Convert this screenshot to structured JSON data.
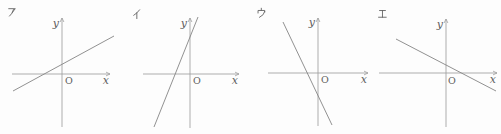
{
  "figure": {
    "width": 501,
    "height": 134,
    "background": "#fdfdfd",
    "axis_color": "#9e9e9e",
    "line_color": "#858585",
    "label_color": "#606060"
  },
  "chart_data": [
    {
      "type": "line",
      "panel_label": "ア",
      "x_axis_label": "x",
      "y_axis_label": "y",
      "origin_label": "O",
      "slope_sign": "positive",
      "slope_steepness": "gentle",
      "approx_slope": 0.55,
      "y_intercept_sign": "positive",
      "x_intercept_sign": "negative",
      "axis_ticks": "none",
      "legend": "none"
    },
    {
      "type": "line",
      "panel_label": "イ",
      "x_axis_label": "x",
      "y_axis_label": "y",
      "origin_label": "O",
      "slope_sign": "positive",
      "slope_steepness": "steep",
      "approx_slope": 2.5,
      "y_intercept_sign": "positive",
      "x_intercept_sign": "negative",
      "axis_ticks": "none",
      "legend": "none"
    },
    {
      "type": "line",
      "panel_label": "ウ",
      "x_axis_label": "x",
      "y_axis_label": "y",
      "origin_label": "O",
      "slope_sign": "negative",
      "slope_steepness": "steep",
      "approx_slope": -2.1,
      "y_intercept_sign": "negative",
      "x_intercept_sign": "negative",
      "axis_ticks": "none",
      "legend": "none"
    },
    {
      "type": "line",
      "panel_label": "エ",
      "x_axis_label": "x",
      "y_axis_label": "y",
      "origin_label": "O",
      "slope_sign": "negative",
      "slope_steepness": "gentle",
      "approx_slope": -0.52,
      "y_intercept_sign": "positive",
      "x_intercept_sign": "positive",
      "axis_ticks": "none",
      "legend": "none"
    }
  ],
  "panels": [
    {
      "label": "ア",
      "glyph": "katakana-a",
      "label_pos": [
        8,
        7
      ],
      "x_axis": [
        12,
        74,
        110,
        74
      ],
      "y_axis": [
        62,
        127,
        62,
        18
      ],
      "line": [
        13,
        91,
        114,
        36
      ],
      "x_label": "x",
      "x_label_pos": [
        109,
        84
      ],
      "y_label": "y",
      "y_label_pos": [
        59,
        27
      ],
      "origin_label": "O",
      "origin_pos": [
        65,
        84
      ]
    },
    {
      "label": "イ",
      "glyph": "katakana-i",
      "label_pos": [
        133,
        9
      ],
      "x_axis": [
        143,
        74,
        239,
        74
      ],
      "y_axis": [
        190,
        128,
        190,
        18
      ],
      "line": [
        154,
        127,
        198,
        17
      ],
      "x_label": "x",
      "x_label_pos": [
        238,
        84
      ],
      "y_label": "y",
      "y_label_pos": [
        187,
        27
      ],
      "origin_label": "O",
      "origin_pos": [
        193,
        84
      ]
    },
    {
      "label": "ウ",
      "glyph": "katakana-u",
      "label_pos": [
        257,
        8
      ],
      "x_axis": [
        268,
        73,
        368,
        73
      ],
      "y_axis": [
        318,
        126,
        318,
        18
      ],
      "line": [
        283,
        22,
        332,
        125
      ],
      "x_label": "x",
      "x_label_pos": [
        367,
        83
      ],
      "y_label": "y",
      "y_label_pos": [
        315,
        26
      ],
      "origin_label": "O",
      "origin_pos": [
        321,
        83
      ]
    },
    {
      "label": "エ",
      "glyph": "katakana-e",
      "label_pos": [
        378,
        9
      ],
      "x_axis": [
        379,
        73,
        497,
        73
      ],
      "y_axis": [
        446,
        127,
        446,
        19
      ],
      "line": [
        396,
        39,
        496,
        91
      ],
      "x_label": "x",
      "x_label_pos": [
        496,
        83
      ],
      "y_label": "y",
      "y_label_pos": [
        443,
        28
      ],
      "origin_label": "O",
      "origin_pos": [
        448,
        84
      ]
    }
  ]
}
